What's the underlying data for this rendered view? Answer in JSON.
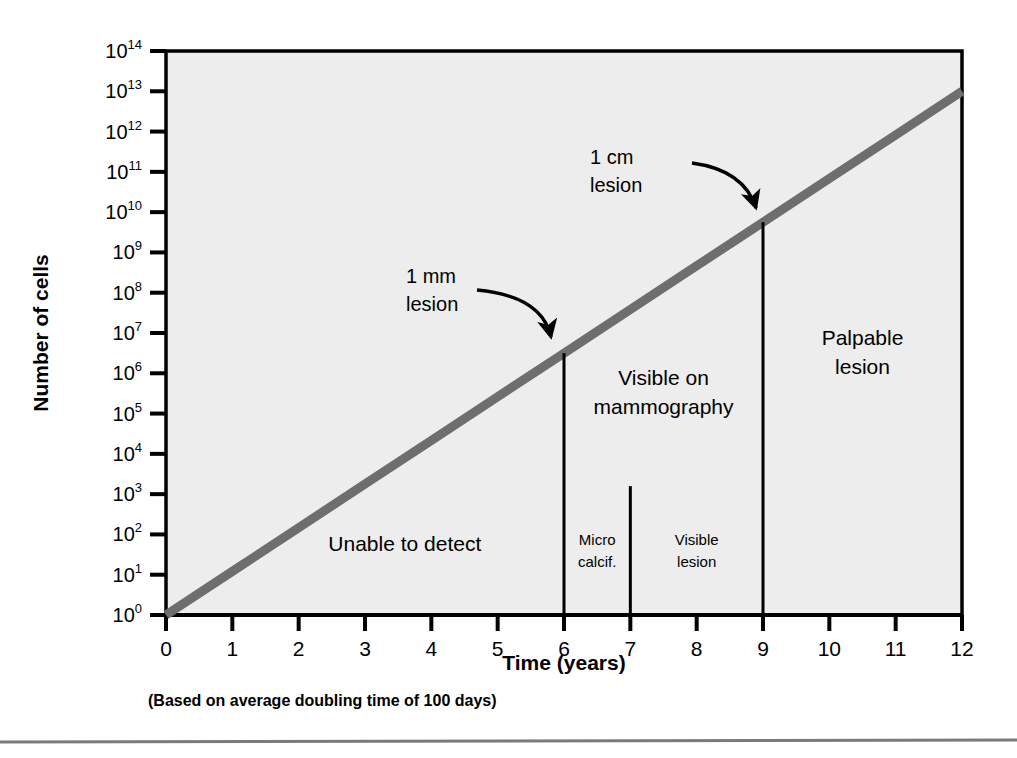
{
  "chart_data": {
    "type": "line",
    "title": "",
    "subtitle": "",
    "caption": "(Based on average doubling time of 100 days)",
    "xlabel": "Time (years)",
    "ylabel": "Number of cells",
    "xlim": [
      0,
      12
    ],
    "ylim_exponents": [
      0,
      14
    ],
    "grid": false,
    "legend": "none",
    "yscale": "log",
    "x_ticks": [
      "0",
      "1",
      "2",
      "3",
      "4",
      "5",
      "6",
      "7",
      "8",
      "9",
      "10",
      "11",
      "12"
    ],
    "y_ticks": [
      {
        "base": "10",
        "exp": "0"
      },
      {
        "base": "10",
        "exp": "1"
      },
      {
        "base": "10",
        "exp": "2"
      },
      {
        "base": "10",
        "exp": "3"
      },
      {
        "base": "10",
        "exp": "4"
      },
      {
        "base": "10",
        "exp": "5"
      },
      {
        "base": "10",
        "exp": "6"
      },
      {
        "base": "10",
        "exp": "7"
      },
      {
        "base": "10",
        "exp": "8"
      },
      {
        "base": "10",
        "exp": "9"
      },
      {
        "base": "10",
        "exp": "10"
      },
      {
        "base": "10",
        "exp": "11"
      },
      {
        "base": "10",
        "exp": "12"
      },
      {
        "base": "10",
        "exp": "13"
      },
      {
        "base": "10",
        "exp": "14"
      }
    ],
    "series": [
      {
        "name": "Tumor cell growth",
        "x": [
          0,
          1,
          2,
          3,
          4,
          5,
          6,
          7,
          8,
          9,
          10,
          11,
          12
        ],
        "y_exponents": [
          0,
          1.083,
          2.167,
          3.25,
          4.333,
          5.417,
          6.5,
          7.583,
          8.667,
          9.75,
          10.833,
          11.917,
          13.0
        ],
        "color": "#6e6e6e"
      }
    ],
    "markers": [
      {
        "name": "1 mm lesion",
        "x": 6,
        "y_exponent": 6.5
      },
      {
        "name": "1 cm lesion",
        "x": 9,
        "y_exponent": 9.75
      }
    ],
    "dividers": [
      {
        "x": 6,
        "top_y_exponent": 6.5,
        "bottom_y_exponent": 0
      },
      {
        "x": 7,
        "top_y_exponent": 3.2,
        "bottom_y_exponent": 0
      },
      {
        "x": 9,
        "top_y_exponent": 9.75,
        "bottom_y_exponent": 0
      }
    ],
    "annotations": [
      {
        "id": "annot-1mm",
        "line1": "1 mm",
        "line2": "lesion",
        "target_x": 6,
        "target_y_exponent": 6.5
      },
      {
        "id": "annot-1cm",
        "line1": "1 cm",
        "line2": "lesion",
        "target_x": 9,
        "target_y_exponent": 9.75
      }
    ],
    "regions": [
      {
        "id": "region-unable",
        "line1": "Unable to detect",
        "line2": "",
        "x_center": 3.6,
        "y_exponent": 1.6
      },
      {
        "id": "region-mammography",
        "line1": "Visible on",
        "line2": "mammography",
        "x_center": 7.5,
        "y_exponent": 5.7
      },
      {
        "id": "region-palpable",
        "line1": "Palpable",
        "line2": "lesion",
        "x_center": 10.5,
        "y_exponent": 6.7
      }
    ],
    "subregions": [
      {
        "id": "subregion-microcalcif",
        "line1": "Micro",
        "line2": "calcif.",
        "x_center": 6.5,
        "y_exponent": 1.75
      },
      {
        "id": "subregion-visible-lesion",
        "line1": "Visible",
        "line2": "lesion",
        "x_center": 8.0,
        "y_exponent": 1.75
      }
    ],
    "colors": {
      "plot_background": "#ededed",
      "axis": "#000000",
      "line": "#6e6e6e",
      "divider": "#000000",
      "page_background": "#ffffff",
      "footer_rule": "#7a7a7a"
    }
  }
}
